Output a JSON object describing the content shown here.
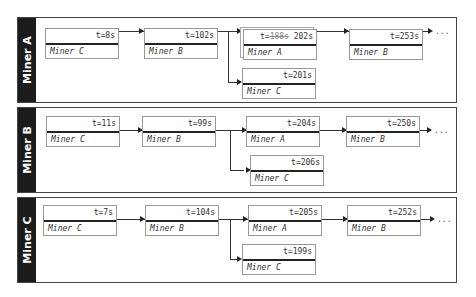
{
  "panels": [
    {
      "label": "Miner A",
      "main_chain": [
        {
          "time": "t=8s",
          "miner": "Miner C"
        },
        {
          "time": "t=102s",
          "miner": "Miner B"
        },
        {
          "time_prefix": "t=",
          "time_struck": "188s",
          "time": "202s",
          "miner": "Miner A"
        },
        {
          "time": "t=253s",
          "miner": "Miner B"
        }
      ],
      "fork": {
        "time": "t=201s",
        "miner": "Miner C"
      },
      "continuation": "..."
    },
    {
      "label": "Miner B",
      "main_chain": [
        {
          "time": "t=11s",
          "miner": "Miner C"
        },
        {
          "time": "t=99s",
          "miner": "Miner B"
        },
        {
          "time": "t=204s",
          "miner": "Miner A"
        },
        {
          "time": "t=250s",
          "miner": "Miner B"
        }
      ],
      "fork": {
        "time": "t=206s",
        "miner": "Miner C"
      },
      "continuation": "..."
    },
    {
      "label": "Miner C",
      "main_chain": [
        {
          "time": "t=7s",
          "miner": "Miner C"
        },
        {
          "time": "t=104s",
          "miner": "Miner B"
        },
        {
          "time": "t=205s",
          "miner": "Miner A"
        },
        {
          "time": "t=252s",
          "miner": "Miner B"
        }
      ],
      "fork": {
        "time": "t=199s",
        "miner": "Miner C"
      },
      "continuation": "..."
    }
  ]
}
